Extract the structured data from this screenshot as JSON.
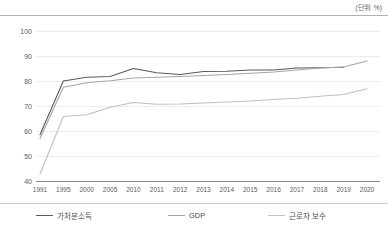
{
  "unit_note": "(단위: %)",
  "chart_data": {
    "type": "line",
    "title": "",
    "subtitle": "",
    "xlabel": "",
    "ylabel": "",
    "unit_label": "(단위: %)",
    "categories": [
      "1991",
      "1995",
      "2000",
      "2005",
      "2010",
      "2011",
      "2012",
      "2013",
      "2014",
      "2015",
      "2016",
      "2017",
      "2018",
      "2019",
      "2020"
    ],
    "ylim": [
      40,
      100
    ],
    "yticks": [
      40,
      50,
      60,
      70,
      80,
      90,
      100
    ],
    "grid": true,
    "legend_position": "bottom",
    "series": [
      {
        "name": "가처분소득",
        "color": "#595959",
        "values": [
          58.5,
          80.0,
          81.5,
          81.8,
          85.0,
          83.3,
          82.6,
          83.8,
          83.9,
          84.4,
          84.4,
          85.2,
          85.3,
          85.5,
          null
        ]
      },
      {
        "name": "GDP",
        "color": "#a6a6a6",
        "values": [
          57.0,
          77.5,
          79.3,
          80.1,
          81.2,
          81.5,
          81.8,
          82.2,
          82.6,
          83.1,
          83.6,
          84.4,
          85.2,
          85.6,
          88.0
        ]
      },
      {
        "name": "근로자 보수",
        "color": "#bfbfbf",
        "values": [
          42.8,
          65.8,
          66.5,
          69.5,
          71.4,
          70.7,
          70.8,
          71.2,
          71.6,
          72.0,
          72.6,
          73.1,
          73.9,
          74.6,
          76.9
        ]
      }
    ]
  },
  "legend": {
    "items": [
      {
        "label": "가처분소득",
        "color": "#595959"
      },
      {
        "label": "GDP",
        "color": "#a6a6a6"
      },
      {
        "label": "근로자 보수",
        "color": "#c4c4c4"
      }
    ]
  }
}
